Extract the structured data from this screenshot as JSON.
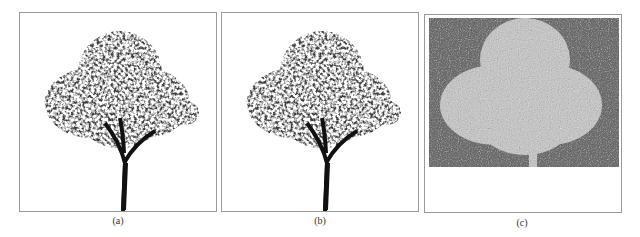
{
  "figure": {
    "panels": [
      {
        "id": "a",
        "caption": "(a)",
        "content": "tree rendering with foliage on white background"
      },
      {
        "id": "b",
        "caption": "(b)",
        "content": "tree rendering with foliage on white background (near-identical to a)"
      },
      {
        "id": "c",
        "caption": "(c)",
        "content": "noisy grayscale map with light tree-shaped silhouette on dark gray background"
      }
    ]
  },
  "colors": {
    "border": "#9a9a9a",
    "foliage": "#3a3a3a",
    "trunk": "#111111",
    "noise_dark": "#6e6e6e",
    "noise_light": "#c4c4c4"
  }
}
